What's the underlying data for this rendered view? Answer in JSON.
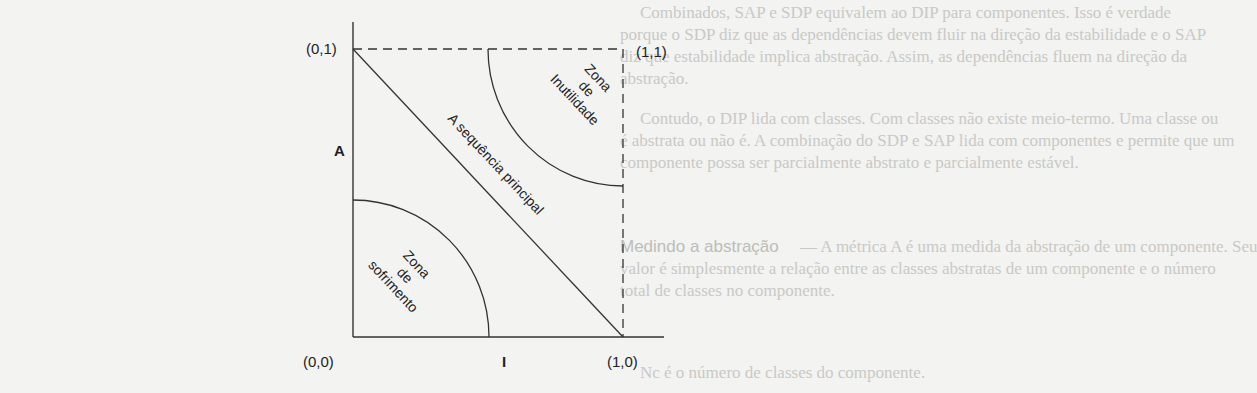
{
  "diagram": {
    "axes": {
      "y_label": "A",
      "x_label": "I"
    },
    "corners": {
      "top_left": "(0,1)",
      "top_right": "(1,1)",
      "bottom_left": "(0,0)",
      "bottom_right": "(1,0)"
    },
    "regions": {
      "main_sequence": "A sequência principal",
      "zone_pain": [
        "Zona",
        "de",
        "sofrimento"
      ],
      "zone_uselessness": [
        "Zona",
        "de",
        "Inutilidade"
      ]
    },
    "colors": {
      "line": "#333333",
      "text": "#222222",
      "background": "#f3f3f1",
      "bleed_text": "#c9c9c6"
    }
  },
  "background_text": {
    "lines": [
      "Combinados, SAP e SDP equivalem ao DIP para componentes. Isso é verdade",
      "porque o SDP diz que as dependências devem fluir na direção da estabilidade e o SAP",
      "diz que estabilidade implica abstração. Assim, as dependências fluem na direção da",
      "abstração.",
      "Contudo, o DIP lida com classes. Com classes não existe meio-termo. Uma classe ou",
      "é abstrata ou não é. A combinação do SDP e SAP lida com componentes e permite que um",
      "componente possa ser parcialmente abstrato e parcialmente estável.",
      "Medindo a abstração",
      "— A métrica A é uma medida da abstração de um componente. Seu",
      "valor é simplesmente a relação entre as classes abstratas de um componente e o número",
      "total de classes no componente.",
      "Nc é o número de classes do componente."
    ]
  }
}
